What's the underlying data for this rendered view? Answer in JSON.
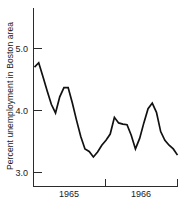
{
  "chart_data": {
    "type": "line",
    "title": "",
    "xlabel": "",
    "ylabel": "Percent unemployment in Boston area",
    "ylim": [
      2.78,
      5.35
    ],
    "xlim": [
      0,
      34
    ],
    "yticks": [
      3.0,
      4.0,
      5.0
    ],
    "ytick_labels": [
      "3.0",
      "4.0",
      "5.0"
    ],
    "xticks": [
      6,
      18,
      30
    ],
    "xtick_labels": [
      "1965",
      "",
      "1966"
    ],
    "xtick_label_positions": [
      6,
      30
    ],
    "grid": false,
    "legend": null,
    "series_name": "Percent unemployment in Boston area",
    "line_color": "#111111",
    "x": [
      0,
      1,
      2,
      3,
      4,
      5,
      6,
      7,
      8,
      9,
      10,
      11,
      12,
      13,
      14,
      15,
      16,
      17,
      18,
      19,
      20,
      21,
      22,
      23,
      24,
      25,
      26,
      27,
      28,
      29,
      30,
      31,
      32,
      33,
      34
    ],
    "values": [
      4.7,
      4.77,
      4.55,
      4.32,
      4.1,
      3.96,
      4.22,
      4.37,
      4.37,
      4.12,
      3.84,
      3.58,
      3.38,
      3.34,
      3.25,
      3.33,
      3.44,
      3.52,
      3.62,
      3.89,
      3.8,
      3.78,
      3.77,
      3.6,
      3.38,
      3.55,
      3.8,
      4.03,
      4.12,
      3.97,
      3.66,
      3.52,
      3.44,
      3.38,
      3.28
    ]
  },
  "axis": {
    "y_tick_labels": [
      "5.0",
      "4.0",
      "3.0"
    ],
    "x_tick_labels": [
      "1965",
      "1966"
    ],
    "y_axis_title": "Percent unemployment in Boston area"
  }
}
